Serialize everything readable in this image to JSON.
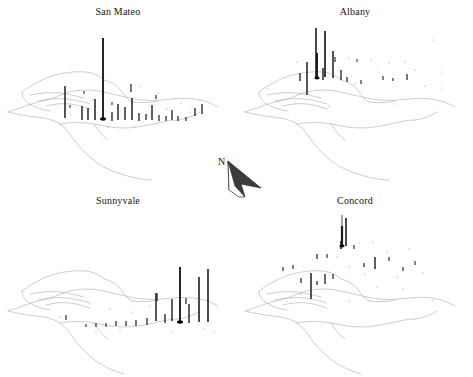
{
  "figure": {
    "type": "small-multiples-map",
    "region": "San Francisco Bay Area",
    "background_color": "#ffffff",
    "coastline_color": "#a9a9a9",
    "bar_color": "#1c1c1c",
    "origin_marker_color": "#000000",
    "title_font_size_px": 10,
    "panel_count": 4,
    "north_arrow": {
      "label": "N",
      "name": "north-arrow",
      "x": 205,
      "y": 150,
      "width": 70,
      "height": 62,
      "direction_degrees": 315,
      "fill_color": "#3b3b3b",
      "outline_color": "#2a2a2a"
    }
  },
  "panels": [
    {
      "id": "san-mateo",
      "title": "San Mateo",
      "position": "top-left",
      "origin_marker": {
        "x": 103,
        "y": 119,
        "r": 3.0
      },
      "leader_line": null,
      "bars": [
        {
          "x": 65,
          "y": 118,
          "h": 32,
          "w": 1.5
        },
        {
          "x": 82,
          "y": 120,
          "h": 14,
          "w": 1.4
        },
        {
          "x": 88,
          "y": 120,
          "h": 12,
          "w": 1.4
        },
        {
          "x": 95,
          "y": 120,
          "h": 21,
          "w": 1.5
        },
        {
          "x": 103,
          "y": 119,
          "h": 81,
          "w": 1.9
        },
        {
          "x": 112,
          "y": 121,
          "h": 9,
          "w": 1.3
        },
        {
          "x": 118,
          "y": 120,
          "h": 16,
          "w": 1.4
        },
        {
          "x": 125,
          "y": 120,
          "h": 13,
          "w": 1.4
        },
        {
          "x": 132,
          "y": 120,
          "h": 22,
          "w": 1.5
        },
        {
          "x": 139,
          "y": 121,
          "h": 8,
          "w": 1.3
        },
        {
          "x": 146,
          "y": 120,
          "h": 6,
          "w": 1.2
        },
        {
          "x": 152,
          "y": 120,
          "h": 15,
          "w": 1.4
        },
        {
          "x": 159,
          "y": 121,
          "h": 6,
          "w": 1.2
        },
        {
          "x": 166,
          "y": 121,
          "h": 5,
          "w": 1.2
        },
        {
          "x": 172,
          "y": 120,
          "h": 10,
          "w": 1.3
        },
        {
          "x": 178,
          "y": 121,
          "h": 5,
          "w": 1.2
        },
        {
          "x": 186,
          "y": 121,
          "h": 4,
          "w": 1.2
        },
        {
          "x": 195,
          "y": 116,
          "h": 8,
          "w": 1.3
        },
        {
          "x": 202,
          "y": 114,
          "h": 10,
          "w": 1.3
        },
        {
          "x": 131,
          "y": 92,
          "h": 8,
          "w": 1.2
        },
        {
          "x": 156,
          "y": 99,
          "h": 4,
          "w": 1.1
        },
        {
          "x": 84,
          "y": 94,
          "h": 3,
          "w": 1.0
        },
        {
          "x": 112,
          "y": 105,
          "h": 3,
          "w": 1.0
        },
        {
          "x": 70,
          "y": 108,
          "h": 3,
          "w": 1.0
        }
      ],
      "dots": [
        {
          "x": 140,
          "y": 86
        },
        {
          "x": 158,
          "y": 93
        },
        {
          "x": 92,
          "y": 100
        },
        {
          "x": 120,
          "y": 112
        },
        {
          "x": 167,
          "y": 109
        },
        {
          "x": 181,
          "y": 103
        },
        {
          "x": 70,
          "y": 114
        },
        {
          "x": 148,
          "y": 116
        },
        {
          "x": 190,
          "y": 112
        },
        {
          "x": 108,
          "y": 127
        },
        {
          "x": 134,
          "y": 126
        },
        {
          "x": 60,
          "y": 125
        }
      ]
    },
    {
      "id": "albany",
      "title": "Albany",
      "position": "top-right",
      "origin_marker": {
        "x": 80,
        "y": 78,
        "r": 2.6
      },
      "leader_line": null,
      "bars": [
        {
          "x": 70,
          "y": 95,
          "h": 33,
          "w": 1.5
        },
        {
          "x": 80,
          "y": 78,
          "h": 25,
          "w": 2.0
        },
        {
          "x": 86,
          "y": 80,
          "h": 12,
          "w": 1.4
        },
        {
          "x": 79,
          "y": 78,
          "h": 50,
          "w": 1.6
        },
        {
          "x": 88,
          "y": 77,
          "h": 46,
          "w": 1.7
        },
        {
          "x": 96,
          "y": 78,
          "h": 27,
          "w": 1.5
        },
        {
          "x": 104,
          "y": 80,
          "h": 10,
          "w": 1.3
        },
        {
          "x": 63,
          "y": 81,
          "h": 8,
          "w": 1.3
        },
        {
          "x": 110,
          "y": 82,
          "h": 5,
          "w": 1.2
        },
        {
          "x": 124,
          "y": 84,
          "h": 4,
          "w": 1.1
        },
        {
          "x": 146,
          "y": 80,
          "h": 4,
          "w": 1.1
        },
        {
          "x": 156,
          "y": 81,
          "h": 3,
          "w": 1.1
        },
        {
          "x": 170,
          "y": 80,
          "h": 6,
          "w": 1.2
        },
        {
          "x": 98,
          "y": 62,
          "h": 5,
          "w": 1.1
        },
        {
          "x": 120,
          "y": 62,
          "h": 3,
          "w": 1.0
        }
      ],
      "dots": [
        {
          "x": 112,
          "y": 58
        },
        {
          "x": 134,
          "y": 60
        },
        {
          "x": 152,
          "y": 63
        },
        {
          "x": 168,
          "y": 62
        },
        {
          "x": 60,
          "y": 62
        },
        {
          "x": 141,
          "y": 72
        },
        {
          "x": 178,
          "y": 70
        },
        {
          "x": 205,
          "y": 72
        },
        {
          "x": 30,
          "y": 89
        },
        {
          "x": 118,
          "y": 84
        },
        {
          "x": 188,
          "y": 86
        },
        {
          "x": 205,
          "y": 88
        },
        {
          "x": 92,
          "y": 106
        },
        {
          "x": 158,
          "y": 104
        },
        {
          "x": 196,
          "y": 40
        }
      ]
    },
    {
      "id": "sunnyvale",
      "title": "Sunnyvale",
      "position": "bottom-left",
      "origin_marker": {
        "x": 180,
        "y": 133,
        "r": 3.0
      },
      "leader_line": null,
      "bars": [
        {
          "x": 180,
          "y": 133,
          "h": 55,
          "w": 1.9
        },
        {
          "x": 199,
          "y": 133,
          "h": 45,
          "w": 1.6
        },
        {
          "x": 208,
          "y": 133,
          "h": 53,
          "w": 1.6
        },
        {
          "x": 156,
          "y": 132,
          "h": 28,
          "w": 1.5
        },
        {
          "x": 172,
          "y": 132,
          "h": 22,
          "w": 1.4
        },
        {
          "x": 189,
          "y": 134,
          "h": 19,
          "w": 1.4
        },
        {
          "x": 165,
          "y": 134,
          "h": 9,
          "w": 1.3
        },
        {
          "x": 147,
          "y": 136,
          "h": 7,
          "w": 1.2
        },
        {
          "x": 136,
          "y": 137,
          "h": 6,
          "w": 1.2
        },
        {
          "x": 126,
          "y": 137,
          "h": 5,
          "w": 1.2
        },
        {
          "x": 116,
          "y": 137,
          "h": 5,
          "w": 1.2
        },
        {
          "x": 106,
          "y": 138,
          "h": 4,
          "w": 1.1
        },
        {
          "x": 96,
          "y": 138,
          "h": 4,
          "w": 1.1
        },
        {
          "x": 86,
          "y": 138,
          "h": 3,
          "w": 1.1
        },
        {
          "x": 66,
          "y": 131,
          "h": 5,
          "w": 1.1
        },
        {
          "x": 157,
          "y": 112,
          "h": 8,
          "w": 1.2
        },
        {
          "x": 186,
          "y": 115,
          "h": 6,
          "w": 1.2
        }
      ],
      "dots": [
        {
          "x": 110,
          "y": 120
        },
        {
          "x": 150,
          "y": 117
        },
        {
          "x": 132,
          "y": 123
        },
        {
          "x": 60,
          "y": 128
        },
        {
          "x": 204,
          "y": 140
        },
        {
          "x": 214,
          "y": 143
        },
        {
          "x": 172,
          "y": 143
        },
        {
          "x": 120,
          "y": 141
        },
        {
          "x": 96,
          "y": 142
        }
      ]
    },
    {
      "id": "concord",
      "title": "Concord",
      "position": "bottom-right",
      "origin_marker": {
        "x": 105,
        "y": 57,
        "r": 2.6
      },
      "leader_line": {
        "x": 105,
        "y1": 26,
        "y2": 55
      },
      "bars": [
        {
          "x": 105,
          "y": 57,
          "h": 20,
          "w": 2.2
        },
        {
          "x": 109,
          "y": 57,
          "h": 28,
          "w": 1.6
        },
        {
          "x": 104,
          "y": 60,
          "h": 8,
          "w": 1.6
        },
        {
          "x": 74,
          "y": 110,
          "h": 26,
          "w": 1.5
        },
        {
          "x": 88,
          "y": 95,
          "h": 10,
          "w": 1.3
        },
        {
          "x": 64,
          "y": 94,
          "h": 5,
          "w": 1.2
        },
        {
          "x": 80,
          "y": 96,
          "h": 4,
          "w": 1.2
        },
        {
          "x": 96,
          "y": 90,
          "h": 5,
          "w": 1.2
        },
        {
          "x": 138,
          "y": 80,
          "h": 12,
          "w": 1.4
        },
        {
          "x": 127,
          "y": 78,
          "h": 4,
          "w": 1.2
        },
        {
          "x": 117,
          "y": 60,
          "h": 4,
          "w": 1.1
        },
        {
          "x": 90,
          "y": 69,
          "h": 4,
          "w": 1.1
        },
        {
          "x": 80,
          "y": 70,
          "h": 5,
          "w": 1.2
        },
        {
          "x": 56,
          "y": 80,
          "h": 4,
          "w": 1.1
        },
        {
          "x": 46,
          "y": 82,
          "h": 4,
          "w": 1.1
        },
        {
          "x": 152,
          "y": 72,
          "h": 4,
          "w": 1.1
        },
        {
          "x": 166,
          "y": 82,
          "h": 4,
          "w": 1.1
        },
        {
          "x": 178,
          "y": 76,
          "h": 4,
          "w": 1.1
        }
      ],
      "dots": [
        {
          "x": 122,
          "y": 54
        },
        {
          "x": 136,
          "y": 53
        },
        {
          "x": 100,
          "y": 68
        },
        {
          "x": 150,
          "y": 63
        },
        {
          "x": 172,
          "y": 60
        },
        {
          "x": 112,
          "y": 78
        },
        {
          "x": 128,
          "y": 85
        },
        {
          "x": 160,
          "y": 88
        },
        {
          "x": 186,
          "y": 84
        },
        {
          "x": 140,
          "y": 98
        },
        {
          "x": 166,
          "y": 100
        },
        {
          "x": 64,
          "y": 105
        },
        {
          "x": 196,
          "y": 112
        },
        {
          "x": 112,
          "y": 112
        },
        {
          "x": 50,
          "y": 112
        }
      ]
    }
  ],
  "chart_data": {
    "type": "bar",
    "title": "",
    "subtitle": "",
    "xlabel": "",
    "ylabel": "",
    "legend_position": "none",
    "grid": false,
    "categories": [
      "San Mateo",
      "Albany",
      "Sunnyvale",
      "Concord"
    ],
    "series": [
      {
        "name": "max bar height (px)",
        "values": [
          81,
          50,
          55,
          28
        ]
      },
      {
        "name": "bar count",
        "values": [
          24,
          15,
          17,
          18
        ]
      }
    ]
  }
}
